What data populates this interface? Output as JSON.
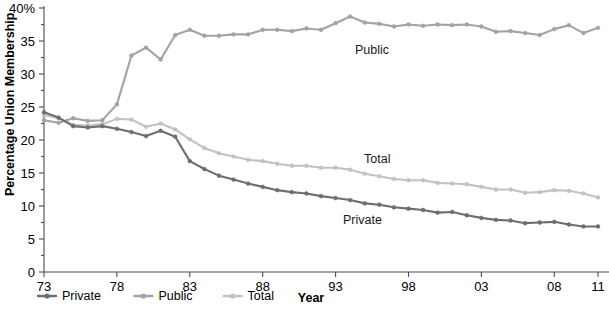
{
  "chart_data": {
    "type": "line",
    "title": "",
    "xlabel": "Year",
    "ylabel": "Percentage Union Membership",
    "xlim": [
      1973,
      2011
    ],
    "ylim": [
      0,
      40
    ],
    "ytick_labels": [
      "40%",
      "35",
      "30",
      "25",
      "20",
      "15",
      "10",
      "5",
      "0"
    ],
    "ytick_values": [
      40,
      35,
      30,
      25,
      20,
      15,
      10,
      5,
      0
    ],
    "xtick_labels": [
      "73",
      "78",
      "83",
      "88",
      "93",
      "98",
      "03",
      "08",
      "11"
    ],
    "xtick_values": [
      1973,
      1978,
      1983,
      1988,
      1993,
      1998,
      2003,
      2008,
      2011
    ],
    "grid": false,
    "legend_position": "bottom-left",
    "markers": "round-dot",
    "x": [
      1973,
      1974,
      1975,
      1976,
      1977,
      1978,
      1979,
      1980,
      1981,
      1982,
      1983,
      1984,
      1985,
      1986,
      1987,
      1988,
      1989,
      1990,
      1991,
      1992,
      1993,
      1994,
      1995,
      1996,
      1997,
      1998,
      1999,
      2000,
      2001,
      2002,
      2003,
      2004,
      2005,
      2006,
      2007,
      2008,
      2009,
      2010,
      2011
    ],
    "series": [
      {
        "name": "Private",
        "color": "#6e6e6e",
        "values": [
          24.2,
          23.4,
          22.1,
          21.9,
          22.1,
          21.7,
          21.2,
          20.6,
          21.4,
          20.5,
          16.8,
          15.6,
          14.6,
          14.0,
          13.4,
          12.9,
          12.4,
          12.1,
          11.9,
          11.5,
          11.2,
          10.9,
          10.4,
          10.2,
          9.8,
          9.6,
          9.4,
          9.0,
          9.1,
          8.6,
          8.2,
          7.9,
          7.8,
          7.4,
          7.5,
          7.6,
          7.2,
          6.9,
          6.9
        ]
      },
      {
        "name": "Public",
        "color": "#a3a3a3",
        "values": [
          23.0,
          22.6,
          23.3,
          22.9,
          23.0,
          25.4,
          32.8,
          34.0,
          32.2,
          35.9,
          36.7,
          35.8,
          35.8,
          36.0,
          36.0,
          36.7,
          36.7,
          36.5,
          36.9,
          36.7,
          37.7,
          38.7,
          37.8,
          37.6,
          37.2,
          37.5,
          37.3,
          37.5,
          37.4,
          37.5,
          37.2,
          36.4,
          36.5,
          36.2,
          35.9,
          36.8,
          37.4,
          36.2,
          37.0
        ]
      },
      {
        "name": "Total",
        "color": "#c2c2c2",
        "values": [
          23.8,
          23.3,
          22.3,
          22.2,
          22.4,
          23.2,
          23.1,
          22.0,
          22.5,
          21.6,
          20.1,
          18.8,
          18.0,
          17.5,
          17.0,
          16.8,
          16.4,
          16.1,
          16.1,
          15.8,
          15.8,
          15.5,
          14.9,
          14.5,
          14.1,
          13.9,
          13.9,
          13.5,
          13.4,
          13.3,
          12.9,
          12.5,
          12.5,
          12.0,
          12.1,
          12.4,
          12.3,
          11.9,
          11.3
        ]
      }
    ]
  },
  "labels": {
    "inline": [
      {
        "name": "Public",
        "text": "Public",
        "x": 355,
        "y": 54
      },
      {
        "name": "Total",
        "text": "Total",
        "x": 364,
        "y": 163
      },
      {
        "name": "Private",
        "text": "Private",
        "x": 343,
        "y": 224
      }
    ]
  },
  "legend": {
    "items": [
      {
        "label": "Private",
        "color": "#6e6e6e"
      },
      {
        "label": "Public",
        "color": "#a3a3a3"
      },
      {
        "label": "Total",
        "color": "#c2c2c2"
      }
    ]
  }
}
